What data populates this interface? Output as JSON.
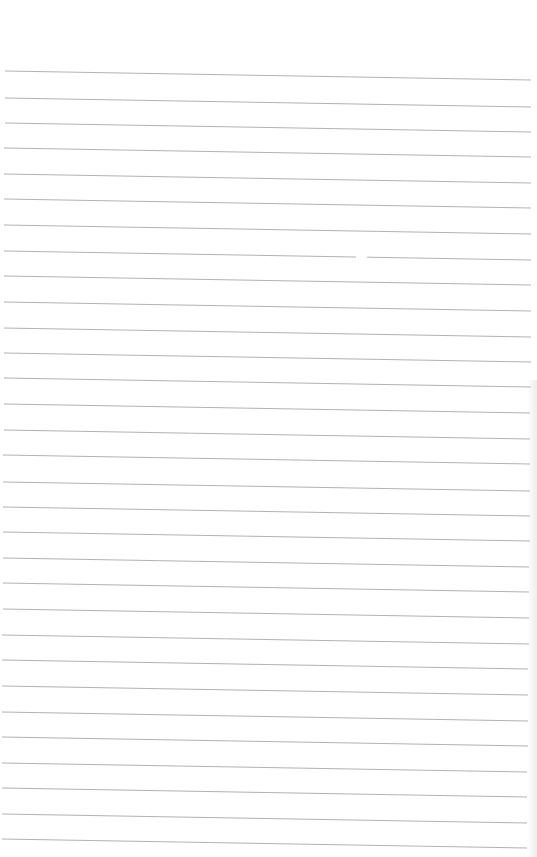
{
  "page": {
    "type": "lined-paper",
    "background_color": "#ffffff",
    "rule_color": "#9a9a9a",
    "rule_count": 32,
    "handwritten_text": []
  },
  "rules": [
    {
      "y_left": 71,
      "y_right": 80,
      "x_left": 5,
      "x_right": 531
    },
    {
      "y_left": 98,
      "y_right": 107,
      "x_left": 5,
      "x_right": 531
    },
    {
      "y_left": 123,
      "y_right": 132,
      "x_left": 5,
      "x_right": 531
    },
    {
      "y_left": 148,
      "y_right": 157,
      "x_left": 4,
      "x_right": 531
    },
    {
      "y_left": 174,
      "y_right": 183,
      "x_left": 4,
      "x_right": 531
    },
    {
      "y_left": 199,
      "y_right": 208,
      "x_left": 4,
      "x_right": 531
    },
    {
      "y_left": 225,
      "y_right": 234,
      "x_left": 4,
      "x_right": 531
    },
    {
      "y_left": 251,
      "y_right": 260,
      "x_left": 4,
      "x_right": 531,
      "gap": [
        356,
        367
      ]
    },
    {
      "y_left": 276,
      "y_right": 285,
      "x_left": 4,
      "x_right": 531
    },
    {
      "y_left": 302,
      "y_right": 311,
      "x_left": 4,
      "x_right": 531
    },
    {
      "y_left": 328,
      "y_right": 337,
      "x_left": 4,
      "x_right": 531
    },
    {
      "y_left": 353,
      "y_right": 362,
      "x_left": 4,
      "x_right": 531
    },
    {
      "y_left": 378,
      "y_right": 387,
      "x_left": 4,
      "x_right": 531
    },
    {
      "y_left": 404,
      "y_right": 413,
      "x_left": 4,
      "x_right": 530
    },
    {
      "y_left": 430,
      "y_right": 439,
      "x_left": 4,
      "x_right": 530
    },
    {
      "y_left": 455,
      "y_right": 464,
      "x_left": 3,
      "x_right": 530
    },
    {
      "y_left": 482,
      "y_right": 491,
      "x_left": 3,
      "x_right": 530
    },
    {
      "y_left": 507,
      "y_right": 516,
      "x_left": 3,
      "x_right": 530
    },
    {
      "y_left": 532,
      "y_right": 541,
      "x_left": 3,
      "x_right": 530
    },
    {
      "y_left": 558,
      "y_right": 567,
      "x_left": 3,
      "x_right": 529
    },
    {
      "y_left": 583,
      "y_right": 592,
      "x_left": 3,
      "x_right": 529
    },
    {
      "y_left": 609,
      "y_right": 618,
      "x_left": 3,
      "x_right": 529
    },
    {
      "y_left": 635,
      "y_right": 644,
      "x_left": 2,
      "x_right": 529
    },
    {
      "y_left": 660,
      "y_right": 669,
      "x_left": 2,
      "x_right": 528
    },
    {
      "y_left": 686,
      "y_right": 695,
      "x_left": 2,
      "x_right": 528
    },
    {
      "y_left": 712,
      "y_right": 721,
      "x_left": 2,
      "x_right": 528
    },
    {
      "y_left": 737,
      "y_right": 746,
      "x_left": 2,
      "x_right": 528
    },
    {
      "y_left": 763,
      "y_right": 772,
      "x_left": 2,
      "x_right": 527
    },
    {
      "y_left": 788,
      "y_right": 797,
      "x_left": 2,
      "x_right": 527
    },
    {
      "y_left": 814,
      "y_right": 823,
      "x_left": 2,
      "x_right": 527
    },
    {
      "y_left": 839,
      "y_right": 848,
      "x_left": 2,
      "x_right": 527
    }
  ]
}
